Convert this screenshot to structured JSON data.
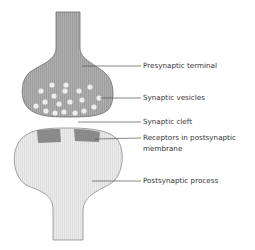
{
  "diagram": {
    "type": "synapse-anatomy",
    "colors": {
      "presynaptic_fill": "#a9a9a9",
      "presynaptic_stroke": "#6e6e6e",
      "vesicle_fill": "#eeeeee",
      "postsynaptic_fill": "#e6e6e6",
      "postsynaptic_stroke": "#8c8c8c",
      "receptor_fill": "#8a8a8a",
      "leader_line": "#555555",
      "label_text": "#333333"
    },
    "labels": {
      "presynaptic_terminal": "Presynaptic terminal",
      "synaptic_vesicles": "Synaptic vesicles",
      "synaptic_cleft": "Synaptic cleft",
      "receptors_line1": "Receptors in postsynaptic",
      "receptors_line2": "membrane",
      "postsynaptic_process": "Postsynaptic process"
    },
    "vesicle_count": 19
  }
}
